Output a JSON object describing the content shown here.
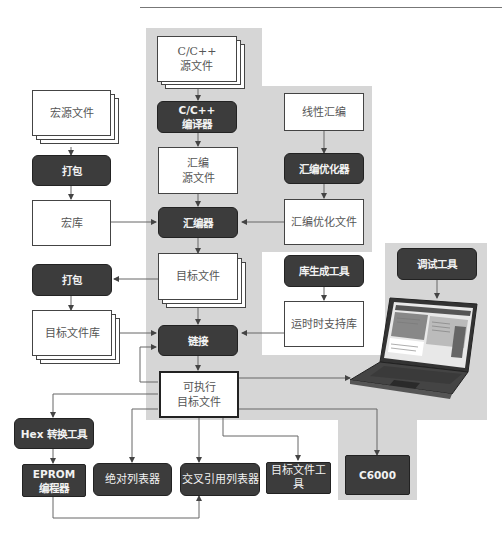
{
  "diagram": {
    "title_rule": true,
    "nodes": {
      "c_source": {
        "label": "C/C++\n源文件",
        "type": "file-stack"
      },
      "c_compiler": {
        "label": "C/C++\n编译器",
        "type": "tool"
      },
      "asm_source": {
        "label": "汇编\n源文件",
        "type": "file"
      },
      "linear_asm": {
        "label": "线性汇编",
        "type": "file"
      },
      "asm_optimizer": {
        "label": "汇编优化器",
        "type": "tool"
      },
      "asm_opt_file": {
        "label": "汇编优化文件",
        "type": "file"
      },
      "macro_source": {
        "label": "宏源文件",
        "type": "file-stack"
      },
      "pack1": {
        "label": "打包",
        "type": "tool"
      },
      "macro_lib": {
        "label": "宏库",
        "type": "file"
      },
      "assembler": {
        "label": "汇编器",
        "type": "tool"
      },
      "object_file": {
        "label": "目标文件",
        "type": "file-stack"
      },
      "pack2": {
        "label": "打包",
        "type": "tool"
      },
      "object_lib": {
        "label": "目标文件库",
        "type": "file-stack"
      },
      "lib_builder": {
        "label": "库生成工具",
        "type": "tool"
      },
      "runtime_lib": {
        "label": "运时时支持库",
        "type": "file"
      },
      "linker": {
        "label": "链接",
        "type": "tool"
      },
      "executable": {
        "label": "可执行\n目标文件",
        "type": "file"
      },
      "debugger": {
        "label": "调试工具",
        "type": "tool"
      },
      "laptop": {
        "label": "laptop",
        "type": "image"
      },
      "hex_tool": {
        "label": "Hex 转换工具",
        "type": "tool"
      },
      "eprom": {
        "label": "EPROM\n编程器",
        "type": "tool"
      },
      "abs_lister": {
        "label": "绝对列表器",
        "type": "tool"
      },
      "xref_lister": {
        "label": "交叉引用列表器",
        "type": "tool"
      },
      "obj_tools": {
        "label": "目标文件工具",
        "type": "tool"
      },
      "c6000": {
        "label": "C6000",
        "type": "tool"
      }
    },
    "edges": [
      [
        "c_source",
        "c_compiler"
      ],
      [
        "c_compiler",
        "asm_source"
      ],
      [
        "asm_source",
        "assembler"
      ],
      [
        "linear_asm",
        "asm_optimizer"
      ],
      [
        "asm_optimizer",
        "asm_opt_file"
      ],
      [
        "asm_opt_file",
        "assembler"
      ],
      [
        "macro_source",
        "pack1"
      ],
      [
        "pack1",
        "macro_lib"
      ],
      [
        "macro_lib",
        "assembler"
      ],
      [
        "assembler",
        "object_file"
      ],
      [
        "object_file",
        "pack2"
      ],
      [
        "pack2",
        "object_lib"
      ],
      [
        "object_file",
        "linker"
      ],
      [
        "object_lib",
        "linker"
      ],
      [
        "lib_builder",
        "runtime_lib"
      ],
      [
        "runtime_lib",
        "linker"
      ],
      [
        "linker",
        "executable"
      ],
      [
        "executable",
        "linker"
      ],
      [
        "debugger",
        "laptop"
      ],
      [
        "executable",
        "laptop"
      ],
      [
        "executable",
        "hex_tool"
      ],
      [
        "hex_tool",
        "eprom"
      ],
      [
        "executable",
        "abs_lister"
      ],
      [
        "executable",
        "xref_lister"
      ],
      [
        "eprom",
        "xref_lister"
      ],
      [
        "executable",
        "obj_tools"
      ],
      [
        "executable",
        "c6000"
      ]
    ],
    "colors": {
      "tool_fill": "#3c3c3c",
      "tool_text": "#f2f2f2",
      "file_fill": "#ffffff",
      "region_grey": "#d6d6d6",
      "line": "#555555"
    }
  }
}
